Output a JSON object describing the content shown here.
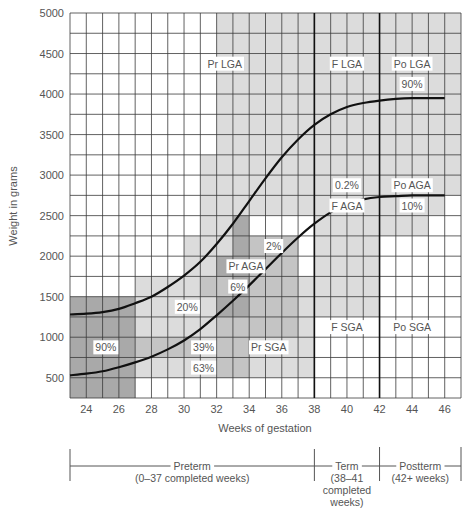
{
  "chart_data": {
    "type": "line",
    "title": "",
    "xlabel": "Weeks of gestation",
    "ylabel": "Weight in grams",
    "xlim": [
      23,
      47
    ],
    "ylim": [
      250,
      5000
    ],
    "x_ticks": [
      24,
      26,
      28,
      30,
      32,
      34,
      36,
      38,
      40,
      42,
      44,
      46
    ],
    "y_ticks": [
      500,
      1000,
      1500,
      2000,
      2500,
      3000,
      3500,
      4000,
      4500,
      5000
    ],
    "grid": true,
    "series": [
      {
        "name": "90th percentile",
        "x": [
          23,
          24,
          25,
          26,
          27,
          28,
          29,
          30,
          31,
          32,
          33,
          34,
          35,
          36,
          37,
          38,
          39,
          40,
          41,
          42,
          43,
          44,
          45,
          46
        ],
        "values": [
          1280,
          1290,
          1310,
          1350,
          1420,
          1500,
          1620,
          1760,
          1930,
          2150,
          2400,
          2680,
          2960,
          3220,
          3440,
          3620,
          3750,
          3840,
          3890,
          3920,
          3940,
          3950,
          3950,
          3950
        ]
      },
      {
        "name": "10th percentile",
        "x": [
          23,
          24,
          25,
          26,
          27,
          28,
          29,
          30,
          31,
          32,
          33,
          34,
          35,
          36,
          37,
          38,
          39,
          40,
          41,
          42,
          43,
          44,
          45,
          46
        ],
        "values": [
          530,
          550,
          580,
          630,
          690,
          760,
          850,
          960,
          1100,
          1270,
          1450,
          1640,
          1840,
          2040,
          2230,
          2400,
          2540,
          2640,
          2700,
          2730,
          2740,
          2750,
          2750,
          2750
        ]
      }
    ],
    "vertical_lines": [
      38,
      42
    ],
    "region_labels": [
      {
        "text": "Pr LGA",
        "x": 32.5,
        "y": 4375
      },
      {
        "text": "F LGA",
        "x": 40,
        "y": 4375
      },
      {
        "text": "Po LGA",
        "x": 44,
        "y": 4375
      },
      {
        "text": "90%",
        "x": 44,
        "y": 4125
      },
      {
        "text": "0.2%",
        "x": 40,
        "y": 2875
      },
      {
        "text": "F AGA",
        "x": 40,
        "y": 2625
      },
      {
        "text": "Po AGA",
        "x": 44,
        "y": 2875
      },
      {
        "text": "10%",
        "x": 44,
        "y": 2625
      },
      {
        "text": "2%",
        "x": 35.5,
        "y": 2125
      },
      {
        "text": "Pr AGA",
        "x": 33.8,
        "y": 1875
      },
      {
        "text": "6%",
        "x": 33.3,
        "y": 1625
      },
      {
        "text": "20%",
        "x": 30.2,
        "y": 1375
      },
      {
        "text": "90%",
        "x": 25.2,
        "y": 875
      },
      {
        "text": "39%",
        "x": 31.2,
        "y": 875
      },
      {
        "text": "63%",
        "x": 31.2,
        "y": 625
      },
      {
        "text": "Pr SGA",
        "x": 35.2,
        "y": 875
      },
      {
        "text": "F SGA",
        "x": 40,
        "y": 1125
      },
      {
        "text": "Po SGA",
        "x": 44,
        "y": 1125
      }
    ],
    "shaded_regions": [
      {
        "x0": 32,
        "x1": 47,
        "y0": 2750,
        "y1": 5000,
        "shade": "light"
      },
      {
        "x0": 23,
        "x1": 47,
        "y0": 2500,
        "y1": 2750,
        "shade": "none"
      },
      {
        "x0": 32,
        "x1": 46,
        "y0": 2500,
        "y1": 3000,
        "shade": "light"
      },
      {
        "x0": 38,
        "x1": 42,
        "y0": 1250,
        "y1": 2500,
        "shade": "light"
      },
      {
        "x0": 42,
        "x1": 45,
        "y0": 2250,
        "y1": 2500,
        "shade": "light"
      },
      {
        "x0": 27,
        "x1": 38,
        "y0": 500,
        "y1": 1750,
        "shade": "light"
      },
      {
        "x0": 31,
        "x1": 34,
        "y0": 1750,
        "y1": 3250,
        "shade": "light"
      },
      {
        "x0": 30,
        "x1": 32,
        "y0": 1750,
        "y1": 2250,
        "shade": "light"
      },
      {
        "x0": 23,
        "x1": 27,
        "y0": 250,
        "y1": 1500,
        "shade": "dark"
      },
      {
        "x0": 32,
        "x1": 34,
        "y0": 1250,
        "y1": 2000,
        "shade": "dark"
      },
      {
        "x0": 33,
        "x1": 34,
        "y0": 2000,
        "y1": 2500,
        "shade": "dark"
      },
      {
        "x0": 34,
        "x1": 37,
        "y0": 1000,
        "y1": 2250,
        "shade": "mid"
      },
      {
        "x0": 31,
        "x1": 33,
        "y0": 1500,
        "y1": 1750,
        "shade": "mid"
      },
      {
        "x0": 32,
        "x1": 34,
        "y0": 500,
        "y1": 1250,
        "shade": "mid"
      },
      {
        "x0": 27,
        "x1": 31,
        "y0": 750,
        "y1": 1000,
        "shade": "mid"
      }
    ],
    "term_bar": {
      "segments": [
        {
          "label": "Preterm",
          "sublabel": "(0–37 completed weeks)",
          "x0": 23,
          "x1": 38
        },
        {
          "label": "Term",
          "sublabel": "(38–41",
          "sublabel2": "completed",
          "sublabel3": "weeks)",
          "x0": 38,
          "x1": 42
        },
        {
          "label": "Postterm",
          "sublabel": "(42+ weeks)",
          "x0": 42,
          "x1": 47
        }
      ]
    },
    "colors": {
      "grid": "#3a3a3a",
      "curve": "#111111",
      "light": "#dcdcdc",
      "mid": "#c4c4c4",
      "dark": "#a9a9a9",
      "text": "#555555"
    }
  }
}
